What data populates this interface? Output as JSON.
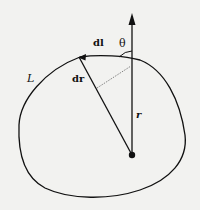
{
  "diagram": {
    "type": "vector-geometry",
    "labels": {
      "curve": "L",
      "line_element": "dl",
      "displacement": "dr",
      "position": "r",
      "angle": "θ"
    },
    "colors": {
      "background": "#f2f2f0",
      "ink": "#111111"
    }
  }
}
